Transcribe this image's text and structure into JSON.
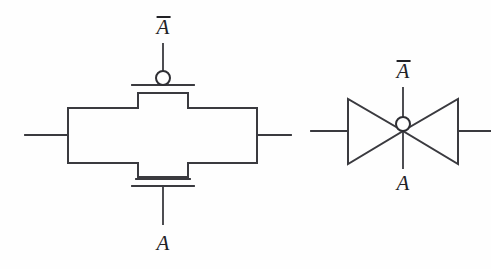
{
  "figure": {
    "background_color": "#fefefe",
    "line_color": "#3a3a3f",
    "text_color": "#222226",
    "width": 491,
    "height": 269
  },
  "symbols": [
    {
      "id": "cross-transmission-gate",
      "name": "Cross-shaped transmission gate symbol",
      "labels": {
        "top": "A",
        "top_overline": true,
        "bottom": "A",
        "bottom_overline": false
      },
      "bubble": "inverting-bubble",
      "terminals": [
        "left-lead",
        "right-lead",
        "top-gate",
        "bottom-gate"
      ]
    },
    {
      "id": "bowtie-transmission-gate",
      "name": "Bowtie transmission gate symbol",
      "labels": {
        "top": "A",
        "top_overline": true,
        "bottom": "A",
        "bottom_overline": false
      },
      "bubble": "inverting-bubble",
      "terminals": [
        "left-lead",
        "right-lead",
        "top-gate",
        "bottom-gate"
      ]
    }
  ],
  "labels": {
    "left_top": "A",
    "left_bottom": "A",
    "right_top": "A",
    "right_bottom": "A"
  }
}
